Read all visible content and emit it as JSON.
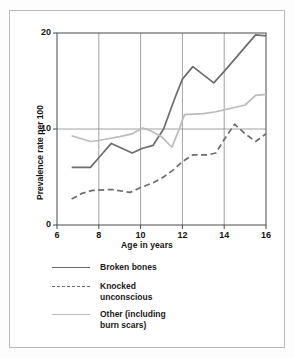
{
  "chart_data": {
    "type": "line",
    "title": "",
    "xlabel": "Age in years",
    "ylabel": "Prevalence rate per 100",
    "xlim": [
      6,
      16
    ],
    "ylim": [
      0,
      20
    ],
    "xticks": [
      "6",
      "8",
      "10",
      "12",
      "14",
      "16"
    ],
    "yticks": [
      "0",
      "10",
      "20"
    ],
    "grid": "vertical gridlines at 8, 10, 12, 14; horizontal gridline at 10",
    "legend_position": "below-plot",
    "series": [
      {
        "name": "Broken bones",
        "style": "solid",
        "color": "#6d6d6d",
        "x": [
          6.7,
          7.6,
          8.0,
          8.6,
          9.6,
          10.1,
          10.6,
          11.1,
          11.6,
          12.0,
          12.5,
          13.5,
          14.0,
          15.5,
          16.0
        ],
        "values": [
          6.0,
          6.0,
          7.0,
          8.5,
          7.5,
          8.0,
          8.3,
          10.0,
          13.0,
          15.2,
          16.5,
          14.8,
          16.0,
          19.8,
          19.7
        ]
      },
      {
        "name": "Knocked unconscious",
        "style": "dashed",
        "color": "#6d6d6d",
        "x": [
          6.7,
          7.2,
          7.7,
          8.6,
          9.5,
          10.0,
          10.6,
          11.1,
          11.6,
          12.0,
          12.5,
          13.2,
          13.6,
          14.0,
          14.5,
          15.0,
          15.5,
          16.0
        ],
        "values": [
          2.7,
          3.3,
          3.6,
          3.7,
          3.4,
          3.9,
          4.4,
          5.0,
          5.8,
          6.6,
          7.3,
          7.3,
          7.5,
          8.9,
          10.5,
          9.5,
          8.7,
          9.5
        ]
      },
      {
        "name": "Other (including burn scars)",
        "style": "solid",
        "color": "#bcbcbc",
        "x": [
          6.7,
          7.6,
          8.0,
          9.0,
          9.6,
          10.1,
          10.5,
          11.0,
          11.5,
          11.9,
          12.1,
          13.0,
          13.6,
          14.0,
          15.0,
          15.5,
          16.0
        ],
        "values": [
          9.3,
          8.7,
          8.8,
          9.2,
          9.5,
          10.1,
          9.8,
          9.2,
          8.1,
          10.3,
          11.5,
          11.6,
          11.8,
          12.0,
          12.5,
          13.5,
          13.6
        ]
      }
    ]
  },
  "axes": {
    "xlabel": "Age in years",
    "ylabel": "Prevalence rate per 100",
    "xticks": [
      "6",
      "8",
      "10",
      "12",
      "14",
      "16"
    ],
    "yticks": [
      "0",
      "10",
      "20"
    ]
  },
  "legend": {
    "items": [
      {
        "label": "Broken bones",
        "swatch": "solid-dark-line-swatch"
      },
      {
        "label": "Knocked\nunconscious",
        "swatch": "dashed-dark-line-swatch"
      },
      {
        "label": "Other (including\nburn scars)",
        "swatch": "solid-light-line-swatch"
      }
    ]
  },
  "colors": {
    "series_dark": "#6d6d6d",
    "series_light": "#bcbcbc",
    "axis": "#4a4a4a",
    "grid": "#8c8c8c",
    "border": "#b9b9b9",
    "background": "#ffffff"
  }
}
